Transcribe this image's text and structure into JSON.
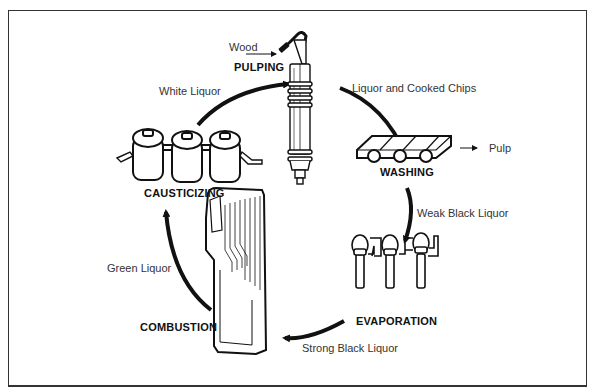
{
  "diagram": {
    "type": "process-cycle",
    "stages": [
      {
        "id": "pulping",
        "label": "PULPING"
      },
      {
        "id": "washing",
        "label": "WASHING"
      },
      {
        "id": "evaporation",
        "label": "EVAPORATION"
      },
      {
        "id": "combustion",
        "label": "COMBUSTION"
      },
      {
        "id": "causticizing",
        "label": "CAUSTICIZING"
      }
    ],
    "flows": [
      {
        "from": "pulping",
        "to": "washing",
        "label": "Liquor and Cooked Chips"
      },
      {
        "from": "washing",
        "to": "evaporation",
        "label": "Weak Black Liquor"
      },
      {
        "from": "evaporation",
        "to": "combustion",
        "label": "Strong Black Liquor"
      },
      {
        "from": "combustion",
        "to": "causticizing",
        "label": "Green Liquor"
      },
      {
        "from": "causticizing",
        "to": "pulping",
        "label": "White Liquor"
      }
    ],
    "inputs": [
      {
        "to": "pulping",
        "label": "Wood"
      }
    ],
    "outputs": [
      {
        "from": "washing",
        "label": "Pulp"
      }
    ],
    "colors": {
      "line": "#111111",
      "background": "#ffffff",
      "frame": "#333333"
    }
  }
}
